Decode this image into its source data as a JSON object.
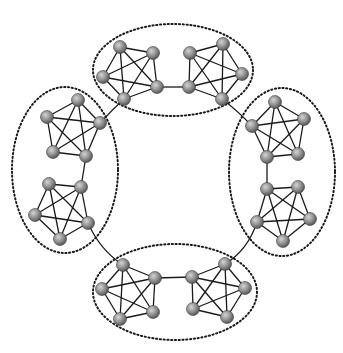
{
  "diagram": {
    "title": "",
    "colors": {
      "background": "#ffffff",
      "edge": "#1a1a1a",
      "node_light": "#c8c8c8",
      "node_dark": "#5a5a5a",
      "ellipse": "#1a1a1a"
    },
    "node_radius": 6.5,
    "groups": [
      {
        "id": "top",
        "ellipse": {
          "cx": 173,
          "cy": 70,
          "rx": 80,
          "ry": 46
        }
      },
      {
        "id": "left",
        "ellipse": {
          "cx": 65,
          "cy": 170,
          "rx": 53,
          "ry": 83
        }
      },
      {
        "id": "right",
        "ellipse": {
          "cx": 282,
          "cy": 172,
          "rx": 53,
          "ry": 84
        }
      },
      {
        "id": "bottom",
        "ellipse": {
          "cx": 175,
          "cy": 292,
          "rx": 82,
          "ry": 48
        }
      }
    ],
    "cliques": [
      {
        "id": "top-left",
        "group": "top",
        "nodes": [
          [
            120,
            47
          ],
          [
            153,
            53
          ],
          [
            103,
            77
          ],
          [
            157,
            87
          ],
          [
            124,
            99
          ]
        ]
      },
      {
        "id": "top-right",
        "group": "top",
        "nodes": [
          [
            190,
            53
          ],
          [
            223,
            44
          ],
          [
            242,
            74
          ],
          [
            189,
            87
          ],
          [
            222,
            99
          ]
        ]
      },
      {
        "id": "left-top",
        "group": "left",
        "nodes": [
          [
            78,
            100
          ],
          [
            47,
            117
          ],
          [
            100,
            123
          ],
          [
            53,
            152
          ],
          [
            86,
            156
          ]
        ]
      },
      {
        "id": "left-bottom",
        "group": "left",
        "nodes": [
          [
            49,
            184
          ],
          [
            81,
            187
          ],
          [
            35,
            215
          ],
          [
            88,
            223
          ],
          [
            60,
            239
          ]
        ]
      },
      {
        "id": "right-top",
        "group": "right",
        "nodes": [
          [
            275,
            102
          ],
          [
            304,
            119
          ],
          [
            252,
            126
          ],
          [
            267,
            157
          ],
          [
            298,
            154
          ]
        ]
      },
      {
        "id": "right-bottom",
        "group": "right",
        "nodes": [
          [
            267,
            189
          ],
          [
            298,
            187
          ],
          [
            257,
            222
          ],
          [
            310,
            219
          ],
          [
            283,
            241
          ]
        ]
      },
      {
        "id": "bottom-left",
        "group": "bottom",
        "nodes": [
          [
            123,
            265
          ],
          [
            155,
            278
          ],
          [
            102,
            289
          ],
          [
            153,
            312
          ],
          [
            120,
            319
          ]
        ]
      },
      {
        "id": "bottom-right",
        "group": "bottom",
        "nodes": [
          [
            192,
            277
          ],
          [
            225,
            264
          ],
          [
            245,
            288
          ],
          [
            193,
            309
          ],
          [
            227,
            317
          ]
        ]
      }
    ],
    "intra_group_links": [
      {
        "from": [
          157,
          87
        ],
        "to": [
          189,
          87
        ]
      },
      {
        "from": [
          86,
          156
        ],
        "to": [
          81,
          187
        ]
      },
      {
        "from": [
          267,
          157
        ],
        "to": [
          267,
          189
        ]
      },
      {
        "from": [
          155,
          278
        ],
        "to": [
          192,
          277
        ]
      }
    ],
    "inter_group_links": [
      {
        "from": [
          124,
          99
        ],
        "to": [
          100,
          123
        ],
        "ctrl": [
          112,
          110
        ]
      },
      {
        "from": [
          222,
          99
        ],
        "to": [
          252,
          126
        ],
        "ctrl": [
          238,
          111
        ]
      },
      {
        "from": [
          88,
          223
        ],
        "to": [
          123,
          265
        ],
        "ctrl": [
          100,
          250
        ]
      },
      {
        "from": [
          257,
          222
        ],
        "to": [
          225,
          264
        ],
        "ctrl": [
          248,
          250
        ]
      }
    ]
  }
}
